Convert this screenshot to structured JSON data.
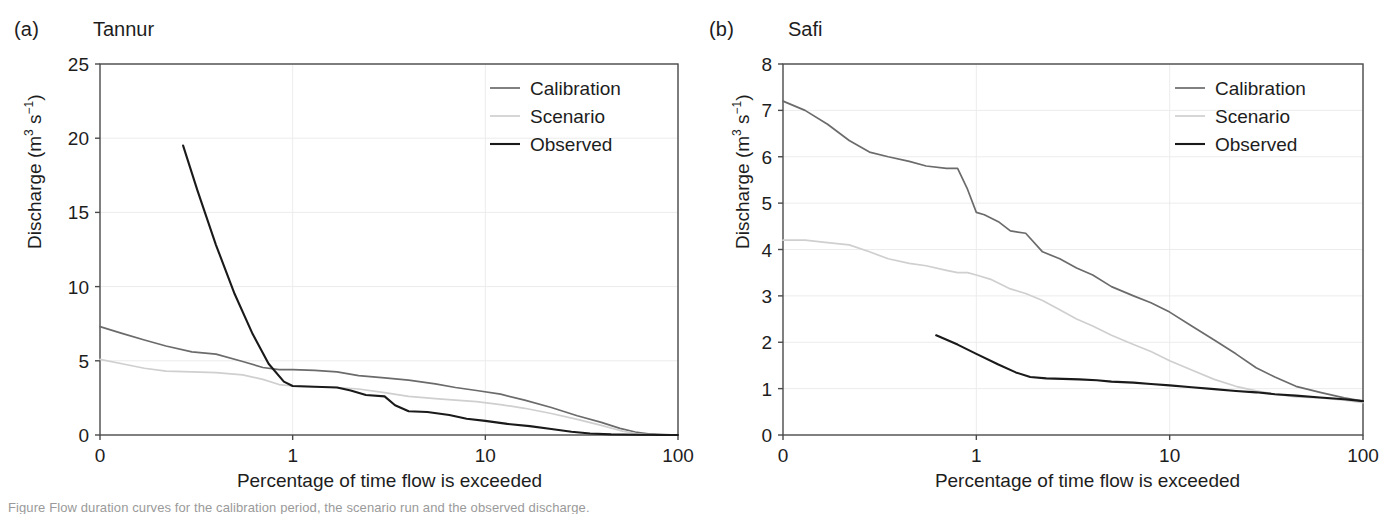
{
  "figure": {
    "background": "#ffffff",
    "axis_color": "#4a4a4a",
    "grid_color": "#ececec",
    "text_color": "#1d1d1d"
  },
  "series_colors": {
    "calibration": "#6b6b6b",
    "scenario": "#cfcfcf",
    "observed": "#1a1a1a"
  },
  "legend": {
    "calibration_label": "Calibration",
    "scenario_label": "Scenario",
    "observed_label": "Observed"
  },
  "panel_a": {
    "tag": "(a)",
    "title": "Tannur",
    "ylabel_main": "Discharge (m",
    "ylabel_sup1": "3",
    "ylabel_mid": " s",
    "ylabel_sup2": "−1",
    "ylabel_end": ")",
    "xlabel": "Percentage of time flow is exceeded",
    "yticks": [
      "0",
      "5",
      "10",
      "15",
      "20",
      "25"
    ],
    "xticks": [
      "0",
      "1",
      "10",
      "100"
    ]
  },
  "panel_b": {
    "tag": "(b)",
    "title": "Safi",
    "ylabel_main": "Discharge (m",
    "ylabel_sup1": "3",
    "ylabel_mid": " s",
    "ylabel_sup2": "−1",
    "ylabel_end": ")",
    "xlabel": "Percentage of time flow is exceeded",
    "yticks": [
      "0",
      "1",
      "2",
      "3",
      "4",
      "5",
      "6",
      "7",
      "8"
    ],
    "xticks": [
      "0",
      "1",
      "10",
      "100"
    ]
  },
  "caption": {
    "text": "Figure  Flow duration curves for the calibration period, the scenario run and the observed discharge."
  },
  "chart_data": [
    {
      "id": "tannur",
      "type": "line",
      "title": "Tannur",
      "panel_tag": "(a)",
      "xlabel": "Percentage of time flow is exceeded",
      "ylabel": "Discharge (m3 s-1)",
      "xscale": "log",
      "xlim": [
        0.1,
        100
      ],
      "ylim": [
        0,
        25
      ],
      "xticks": [
        0.1,
        1,
        10,
        100
      ],
      "xticklabels": [
        "0",
        "1",
        "10",
        "100"
      ],
      "yticks": [
        0,
        5,
        10,
        15,
        20,
        25
      ],
      "grid": true,
      "legend_position": "top-right",
      "series": [
        {
          "name": "Calibration",
          "color": "#6b6b6b",
          "x": [
            0.1,
            0.13,
            0.17,
            0.22,
            0.3,
            0.4,
            0.55,
            0.7,
            0.85,
            1.0,
            1.3,
            1.7,
            2.2,
            3.0,
            4.0,
            5.5,
            7.0,
            9.0,
            12,
            16,
            22,
            30,
            40,
            50,
            60,
            70,
            85,
            100
          ],
          "y": [
            7.3,
            6.85,
            6.4,
            6.0,
            5.6,
            5.45,
            4.95,
            4.55,
            4.4,
            4.4,
            4.35,
            4.25,
            4.0,
            3.85,
            3.7,
            3.45,
            3.2,
            3.0,
            2.75,
            2.35,
            1.85,
            1.3,
            0.85,
            0.45,
            0.2,
            0.08,
            0.03,
            0.0
          ]
        },
        {
          "name": "Scenario",
          "color": "#cfcfcf",
          "x": [
            0.1,
            0.13,
            0.17,
            0.22,
            0.3,
            0.4,
            0.55,
            0.7,
            0.85,
            1.0,
            1.3,
            1.7,
            2.2,
            3.0,
            4.0,
            5.5,
            7.0,
            9.0,
            12,
            16,
            22,
            30,
            40,
            50,
            60,
            70,
            85,
            100
          ],
          "y": [
            5.1,
            4.8,
            4.5,
            4.3,
            4.25,
            4.2,
            4.05,
            3.75,
            3.4,
            3.3,
            3.25,
            3.2,
            3.1,
            2.85,
            2.6,
            2.45,
            2.35,
            2.25,
            2.05,
            1.8,
            1.45,
            1.05,
            0.65,
            0.3,
            0.1,
            0.03,
            0.0,
            0.0
          ]
        },
        {
          "name": "Observed",
          "color": "#1a1a1a",
          "x": [
            0.27,
            0.32,
            0.4,
            0.5,
            0.62,
            0.75,
            0.9,
            1.0,
            1.3,
            1.7,
            2.0,
            2.4,
            3.0,
            3.4,
            4.0,
            5.0,
            6.5,
            8.0,
            10,
            13,
            17,
            22,
            28,
            35,
            45,
            60,
            80,
            100
          ],
          "y": [
            19.5,
            16.5,
            12.8,
            9.5,
            6.8,
            4.8,
            3.6,
            3.3,
            3.25,
            3.2,
            3.0,
            2.7,
            2.6,
            2.0,
            1.6,
            1.55,
            1.35,
            1.1,
            0.95,
            0.75,
            0.6,
            0.4,
            0.22,
            0.1,
            0.04,
            0.02,
            0.0,
            0.0
          ]
        }
      ]
    },
    {
      "id": "safi",
      "type": "line",
      "title": "Safi",
      "panel_tag": "(b)",
      "xlabel": "Percentage of time flow is exceeded",
      "ylabel": "Discharge (m3 s-1)",
      "xscale": "log",
      "xlim": [
        0.1,
        100
      ],
      "ylim": [
        0,
        8
      ],
      "xticks": [
        0.1,
        1,
        10,
        100
      ],
      "xticklabels": [
        "0",
        "1",
        "10",
        "100"
      ],
      "yticks": [
        0,
        1,
        2,
        3,
        4,
        5,
        6,
        7,
        8
      ],
      "grid": true,
      "legend_position": "top-right",
      "series": [
        {
          "name": "Calibration",
          "color": "#6b6b6b",
          "x": [
            0.1,
            0.13,
            0.17,
            0.22,
            0.28,
            0.35,
            0.45,
            0.55,
            0.7,
            0.8,
            0.9,
            1.0,
            1.1,
            1.3,
            1.5,
            1.8,
            2.2,
            2.7,
            3.3,
            4.0,
            5.0,
            6.5,
            8.0,
            10,
            13,
            17,
            22,
            28,
            35,
            45,
            60,
            80,
            100
          ],
          "y": [
            7.2,
            7.0,
            6.7,
            6.35,
            6.1,
            6.0,
            5.9,
            5.8,
            5.75,
            5.75,
            5.3,
            4.8,
            4.75,
            4.6,
            4.4,
            4.35,
            3.95,
            3.8,
            3.6,
            3.45,
            3.2,
            3.0,
            2.85,
            2.65,
            2.35,
            2.05,
            1.75,
            1.45,
            1.25,
            1.05,
            0.92,
            0.8,
            0.73
          ]
        },
        {
          "name": "Scenario",
          "color": "#cfcfcf",
          "x": [
            0.1,
            0.13,
            0.17,
            0.22,
            0.28,
            0.35,
            0.45,
            0.55,
            0.7,
            0.8,
            0.9,
            1.0,
            1.2,
            1.5,
            1.8,
            2.2,
            2.7,
            3.3,
            4.0,
            5.0,
            6.5,
            8.0,
            10,
            13,
            17,
            22,
            28,
            35,
            45,
            60,
            80,
            100
          ],
          "y": [
            4.2,
            4.2,
            4.15,
            4.1,
            3.95,
            3.8,
            3.7,
            3.65,
            3.55,
            3.5,
            3.5,
            3.45,
            3.35,
            3.15,
            3.05,
            2.9,
            2.7,
            2.5,
            2.35,
            2.15,
            1.95,
            1.8,
            1.6,
            1.4,
            1.2,
            1.05,
            0.95,
            0.88,
            0.82,
            0.8,
            0.75,
            0.7
          ]
        },
        {
          "name": "Observed",
          "color": "#1a1a1a",
          "x": [
            0.62,
            0.8,
            1.0,
            1.3,
            1.6,
            1.9,
            2.3,
            2.8,
            3.4,
            4.2,
            5.0,
            6.5,
            8.0,
            10,
            13,
            17,
            22,
            28,
            35,
            45,
            60,
            80,
            100
          ],
          "y": [
            2.15,
            1.95,
            1.75,
            1.52,
            1.35,
            1.25,
            1.22,
            1.21,
            1.2,
            1.18,
            1.15,
            1.13,
            1.1,
            1.07,
            1.03,
            0.99,
            0.95,
            0.92,
            0.88,
            0.85,
            0.81,
            0.77,
            0.73
          ]
        }
      ]
    }
  ]
}
